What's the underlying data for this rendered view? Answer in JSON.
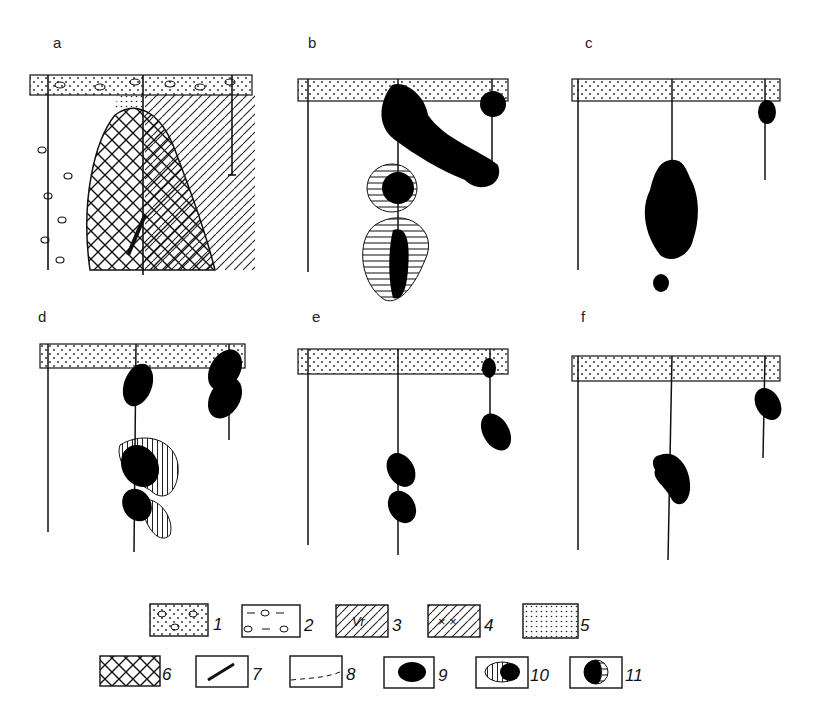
{
  "figure": {
    "panels": [
      {
        "id": "a",
        "label": "a",
        "content": "geological cross-section with intrusive body (crosshatch), breccia zones, three boreholes"
      },
      {
        "id": "b",
        "label": "b",
        "content": "ore bodies with oxidation halos, three boreholes"
      },
      {
        "id": "c",
        "label": "c",
        "content": "large ore body on central borehole, small body on right borehole"
      },
      {
        "id": "d",
        "label": "d",
        "content": "multiple lens ore bodies with vertical-hatched halos"
      },
      {
        "id": "e",
        "label": "e",
        "content": "small lens ore bodies along boreholes"
      },
      {
        "id": "f",
        "label": "f",
        "content": "two ore bodies on boreholes"
      }
    ],
    "legend": [
      {
        "num": "1",
        "pattern": "dotted-with-pebbles"
      },
      {
        "num": "2",
        "pattern": "pebbles-and-dashes"
      },
      {
        "num": "3",
        "pattern": "diagonal-hatch-Vr",
        "text": "Vr"
      },
      {
        "num": "4",
        "pattern": "diagonal-hatch-x"
      },
      {
        "num": "5",
        "pattern": "fine-dots"
      },
      {
        "num": "6",
        "pattern": "crosshatch"
      },
      {
        "num": "7",
        "pattern": "diagonal-line"
      },
      {
        "num": "8",
        "pattern": "dashed-line"
      },
      {
        "num": "9",
        "pattern": "black-ellipse"
      },
      {
        "num": "10",
        "pattern": "vertical-hatch-with-black"
      },
      {
        "num": "11",
        "pattern": "black-with-horizontal-hatch"
      }
    ]
  }
}
